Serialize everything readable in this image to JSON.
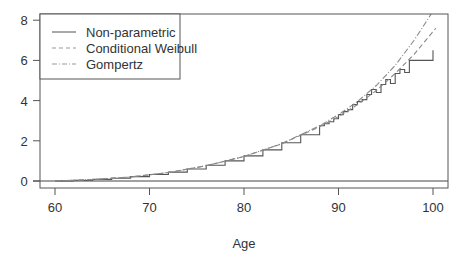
{
  "chart_data": {
    "type": "line",
    "title": "",
    "xlabel": "Age",
    "ylabel": "",
    "xlim": [
      58.5,
      101.5
    ],
    "ylim": [
      -0.3,
      8.3
    ],
    "xticks": [
      60,
      70,
      80,
      90,
      100
    ],
    "yticks": [
      0,
      2,
      4,
      6,
      8
    ],
    "grid": false,
    "legend_position": "top-left",
    "reference_line": {
      "y": 0
    },
    "series": [
      {
        "name": "Non-parametric",
        "style": "solid",
        "step": true,
        "x": [
          60,
          62,
          64,
          66,
          68,
          70,
          72,
          74,
          76,
          78,
          80,
          82,
          84,
          86,
          88,
          88.5,
          89,
          89.5,
          90,
          90.5,
          91,
          91.5,
          92,
          92.5,
          93,
          93.5,
          94,
          94.5,
          95,
          95.5,
          96,
          96.5,
          97,
          97.5,
          100,
          100
        ],
        "values": [
          0.0,
          0.03,
          0.08,
          0.14,
          0.22,
          0.32,
          0.44,
          0.6,
          0.78,
          1.0,
          1.25,
          1.55,
          1.9,
          2.3,
          2.75,
          2.85,
          2.95,
          3.1,
          3.3,
          3.45,
          3.55,
          3.8,
          3.95,
          4.05,
          4.3,
          4.55,
          4.4,
          4.8,
          5.05,
          4.85,
          5.35,
          5.55,
          5.4,
          6.0,
          6.0,
          6.5
        ]
      },
      {
        "name": "Conditional Weibull",
        "style": "dashed",
        "x": [
          60,
          64,
          68,
          72,
          76,
          80,
          84,
          88,
          90,
          92,
          94,
          96,
          98,
          100.3
        ],
        "values": [
          0.0,
          0.07,
          0.2,
          0.42,
          0.76,
          1.22,
          1.85,
          2.7,
          3.2,
          3.8,
          4.5,
          5.35,
          6.3,
          7.6
        ]
      },
      {
        "name": "Gompertz",
        "style": "dotdash",
        "x": [
          60,
          64,
          68,
          72,
          76,
          80,
          84,
          88,
          90,
          92,
          94,
          96,
          98,
          99.8
        ],
        "values": [
          0.0,
          0.07,
          0.2,
          0.42,
          0.76,
          1.22,
          1.86,
          2.75,
          3.3,
          3.95,
          4.75,
          5.75,
          7.0,
          8.3
        ]
      }
    ]
  },
  "colors": {
    "axis": "#444444",
    "text": "#333333",
    "series": "#555555",
    "legend_dashed": "#999999"
  }
}
